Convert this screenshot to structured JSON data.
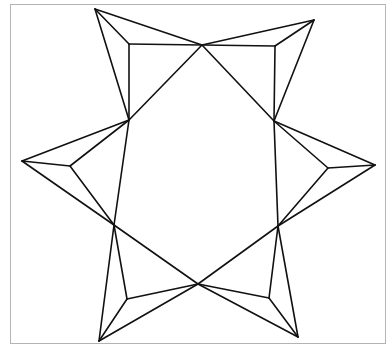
{
  "figure": {
    "stroke_color": "#111111",
    "frame_color": "#b4b4b4",
    "background": "#ffffff",
    "hexagon_vertices": [
      {
        "name": "top",
        "x": 202,
        "y": 45
      },
      {
        "name": "upper-right",
        "x": 274,
        "y": 121
      },
      {
        "name": "lower-right",
        "x": 278,
        "y": 226
      },
      {
        "name": "bottom",
        "x": 198,
        "y": 284
      },
      {
        "name": "lower-left",
        "x": 114,
        "y": 225
      },
      {
        "name": "upper-left",
        "x": 129,
        "y": 120
      }
    ],
    "flaps": [
      {
        "name": "top-left-flap",
        "tip": [
          95,
          9
        ],
        "inner": [
          129,
          44
        ],
        "a": [
          129,
          120
        ],
        "b": [
          202,
          45
        ]
      },
      {
        "name": "top-right-flap",
        "tip": [
          314,
          20
        ],
        "inner": [
          275,
          46
        ],
        "a": [
          202,
          45
        ],
        "b": [
          274,
          121
        ]
      },
      {
        "name": "right-flap",
        "tip": [
          375,
          165
        ],
        "inner": [
          328,
          168
        ],
        "a": [
          274,
          121
        ],
        "b": [
          278,
          226
        ]
      },
      {
        "name": "bottom-right-flap",
        "tip": [
          298,
          337
        ],
        "inner": [
          269,
          298
        ],
        "a": [
          278,
          226
        ],
        "b": [
          198,
          284
        ]
      },
      {
        "name": "bottom-left-flap",
        "tip": [
          99,
          341
        ],
        "inner": [
          127,
          299
        ],
        "a": [
          198,
          284
        ],
        "b": [
          114,
          225
        ]
      },
      {
        "name": "left-flap",
        "tip": [
          22,
          161
        ],
        "inner": [
          70,
          166
        ],
        "a": [
          114,
          225
        ],
        "b": [
          129,
          120
        ]
      }
    ]
  }
}
